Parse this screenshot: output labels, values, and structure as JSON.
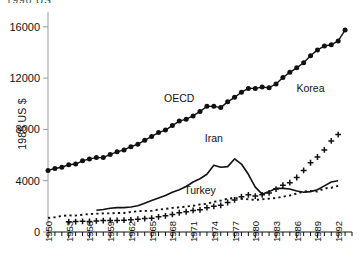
{
  "figure": {
    "top_clipped_text": "1990 US",
    "ylabel": "1985 US $",
    "background": "#ffffff",
    "ink": "#111111",
    "axis_color": "#9a9a9a"
  },
  "chart_data": {
    "type": "line",
    "title": "",
    "xlabel": "",
    "ylabel": "1985 US $",
    "xlim": [
      1950,
      1994
    ],
    "ylim": [
      0,
      17000
    ],
    "yticks": [
      0,
      4000,
      8000,
      12000,
      16000
    ],
    "ytick_labels": [
      "0",
      "4000",
      "8000",
      "12000",
      "16000"
    ],
    "xticks": [
      1950,
      1953,
      1956,
      1959,
      1962,
      1965,
      1968,
      1971,
      1974,
      1977,
      1980,
      1983,
      1986,
      1989,
      1992
    ],
    "xtick_labels": [
      "1950",
      "1953",
      "1956",
      "1959",
      "1962",
      "1965",
      "1968",
      "1971",
      "1974",
      "1977",
      "1980",
      "1983",
      "1986",
      "1989",
      "1992"
    ],
    "xtick_minor_step": 1,
    "grid": false,
    "legend": "inline-annotations",
    "series": [
      {
        "name": "OECD",
        "marker": "filled-circle",
        "line_style": "solid",
        "color": "#111111",
        "label_x": 1969,
        "label_y": 10100,
        "x": [
          1950,
          1951,
          1952,
          1953,
          1954,
          1955,
          1956,
          1957,
          1958,
          1959,
          1960,
          1961,
          1962,
          1963,
          1964,
          1965,
          1966,
          1967,
          1968,
          1969,
          1970,
          1971,
          1972,
          1973,
          1974,
          1975,
          1976,
          1977,
          1978,
          1979,
          1980,
          1981,
          1982,
          1983,
          1984,
          1985,
          1986,
          1987,
          1988,
          1989,
          1990,
          1991,
          1992,
          1993
        ],
        "y": [
          4800,
          4950,
          5050,
          5250,
          5300,
          5550,
          5700,
          5800,
          5800,
          6050,
          6250,
          6400,
          6650,
          6850,
          7150,
          7450,
          7750,
          7950,
          8300,
          8650,
          8800,
          9050,
          9400,
          9800,
          9800,
          9700,
          10150,
          10500,
          10900,
          11200,
          11200,
          11300,
          11250,
          11550,
          12050,
          12450,
          12800,
          13200,
          13750,
          14200,
          14500,
          14600,
          14900,
          15750
        ]
      },
      {
        "name": "Korea",
        "marker": "plus",
        "line_style": "none",
        "color": "#111111",
        "label_x": 1988,
        "label_y": 10900,
        "x": [
          1953,
          1954,
          1955,
          1956,
          1957,
          1958,
          1959,
          1960,
          1961,
          1962,
          1963,
          1964,
          1965,
          1966,
          1967,
          1968,
          1969,
          1970,
          1971,
          1972,
          1973,
          1974,
          1975,
          1976,
          1977,
          1978,
          1979,
          1980,
          1981,
          1982,
          1983,
          1984,
          1985,
          1986,
          1987,
          1988,
          1989,
          1990,
          1991,
          1992
        ],
        "y": [
          800,
          810,
          830,
          820,
          860,
          890,
          900,
          900,
          920,
          950,
          1000,
          1050,
          1080,
          1180,
          1260,
          1370,
          1500,
          1580,
          1680,
          1730,
          1900,
          2000,
          2080,
          2300,
          2500,
          2750,
          2900,
          2800,
          2900,
          3050,
          3350,
          3650,
          3850,
          4250,
          4800,
          5400,
          5850,
          6400,
          7100,
          7600
        ]
      },
      {
        "name": "Iran",
        "marker": "none",
        "line_style": "solid",
        "color": "#111111",
        "label_x": 1974,
        "label_y": 7000,
        "x": [
          1957,
          1958,
          1959,
          1960,
          1961,
          1962,
          1963,
          1964,
          1965,
          1966,
          1967,
          1968,
          1969,
          1970,
          1971,
          1972,
          1973,
          1974,
          1975,
          1976,
          1977,
          1978,
          1979,
          1980,
          1981,
          1982,
          1983,
          1984,
          1985,
          1986,
          1987,
          1988,
          1989,
          1990,
          1991,
          1992
        ],
        "y": [
          1700,
          1750,
          1850,
          1900,
          1900,
          1950,
          2050,
          2250,
          2450,
          2650,
          2850,
          3100,
          3300,
          3550,
          3900,
          4150,
          4500,
          5200,
          5050,
          5100,
          5700,
          5300,
          4500,
          3500,
          2950,
          3150,
          3400,
          3400,
          3350,
          3200,
          3100,
          3150,
          3300,
          3600,
          3900,
          4000
        ]
      },
      {
        "name": "Turkey",
        "marker": "none",
        "line_style": "dotted",
        "color": "#111111",
        "label_x": 1972,
        "label_y": 2950,
        "x": [
          1950,
          1951,
          1952,
          1953,
          1954,
          1955,
          1956,
          1957,
          1958,
          1959,
          1960,
          1961,
          1962,
          1963,
          1964,
          1965,
          1966,
          1967,
          1968,
          1969,
          1970,
          1971,
          1972,
          1973,
          1974,
          1975,
          1976,
          1977,
          1978,
          1979,
          1980,
          1981,
          1982,
          1983,
          1984,
          1985,
          1986,
          1987,
          1988,
          1989,
          1990,
          1991,
          1992
        ],
        "y": [
          1100,
          1150,
          1250,
          1300,
          1280,
          1350,
          1400,
          1430,
          1450,
          1450,
          1480,
          1480,
          1560,
          1620,
          1650,
          1650,
          1750,
          1800,
          1880,
          1920,
          1980,
          2050,
          2150,
          2200,
          2350,
          2450,
          2600,
          2650,
          2600,
          2550,
          2500,
          2550,
          2600,
          2650,
          2750,
          2850,
          3000,
          3150,
          3200,
          3150,
          3400,
          3450,
          3600
        ]
      }
    ]
  }
}
